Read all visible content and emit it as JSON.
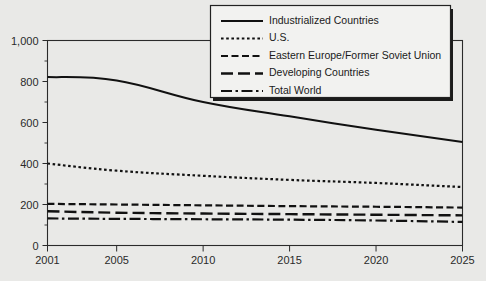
{
  "chart_data": {
    "type": "line",
    "title": "",
    "xlabel": "",
    "ylabel": "",
    "xlim": [
      2001,
      2025
    ],
    "ylim": [
      0,
      1000
    ],
    "x_ticks": [
      "2001",
      "2005",
      "2010",
      "2015",
      "2020",
      "2025"
    ],
    "x_tick_values": [
      2001,
      2005,
      2010,
      2015,
      2020,
      2025
    ],
    "y_ticks": [
      "0",
      "200",
      "400",
      "600",
      "800",
      "1,000"
    ],
    "y_tick_values": [
      0,
      200,
      400,
      600,
      800,
      1000
    ],
    "y_minor_ticks": [
      100,
      300,
      500,
      700,
      900
    ],
    "grid": false,
    "legend_position": "top-right",
    "x": [
      2001,
      2005,
      2010,
      2015,
      2020,
      2025
    ],
    "series": [
      {
        "name": "Industrialized Countries",
        "style": "solid",
        "values": [
          822,
          805,
          700,
          630,
          565,
          505
        ]
      },
      {
        "name": "U.S.",
        "style": "dotted",
        "values": [
          400,
          365,
          340,
          320,
          305,
          285
        ]
      },
      {
        "name": "Eastern Europe/Former Soviet Union",
        "style": "dashed",
        "values": [
          203,
          200,
          196,
          192,
          189,
          185
        ]
      },
      {
        "name": "Developing Countries",
        "style": "long-dash",
        "values": [
          167,
          160,
          156,
          153,
          150,
          147
        ]
      },
      {
        "name": "Total World",
        "style": "dash-dot",
        "values": [
          132,
          130,
          128,
          126,
          122,
          115
        ]
      }
    ]
  },
  "legend": {
    "items": [
      {
        "label": "Industrialized Countries",
        "style": "solid"
      },
      {
        "label": "U.S.",
        "style": "dotted"
      },
      {
        "label": "Eastern Europe/Former Soviet Union",
        "style": "dashed"
      },
      {
        "label": "Developing Countries",
        "style": "long-dash"
      },
      {
        "label": "Total World",
        "style": "dash-dot"
      }
    ]
  },
  "colors": {
    "background": "#e9e9e7",
    "ink": "#111111",
    "frame": "#2b2b2b",
    "legend_fill": "#f2f2f0",
    "legend_shadow": "#1b1b1b"
  }
}
